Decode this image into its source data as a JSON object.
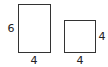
{
  "diagram": {
    "shapes": [
      {
        "name": "rectangle",
        "height_label": "6",
        "width_label": "4"
      },
      {
        "name": "square",
        "height_label": "4",
        "width_label": "4"
      }
    ],
    "colors": {
      "stroke": "#333333",
      "text": "#222222",
      "background": "#ffffff"
    }
  }
}
